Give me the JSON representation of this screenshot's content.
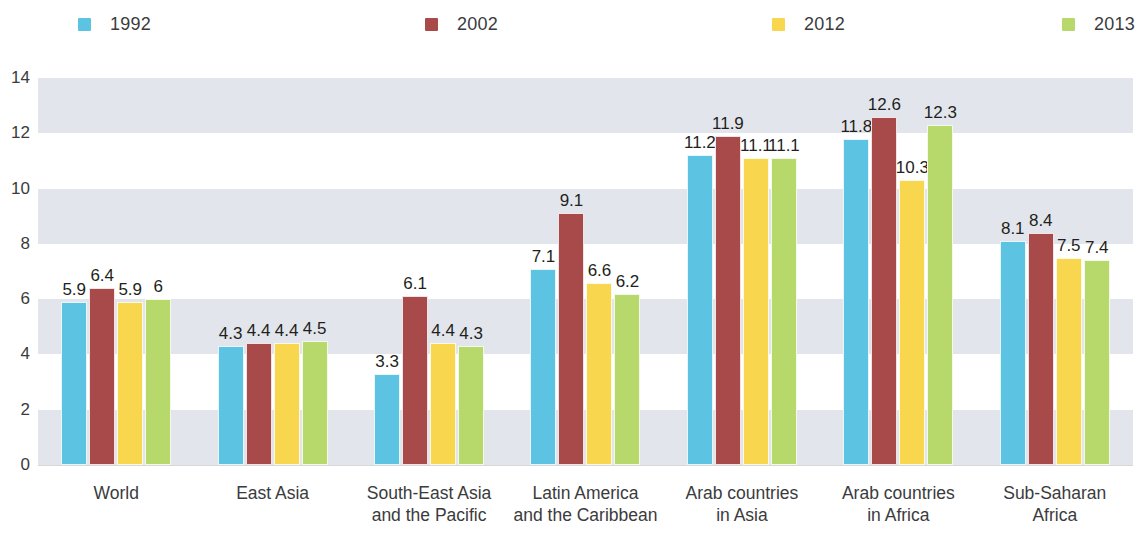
{
  "legend": {
    "items": [
      {
        "label": "1992",
        "color": "#5cc4e2",
        "x": 78
      },
      {
        "label": "2002",
        "color": "#a84a4a",
        "x": 425
      },
      {
        "label": "2012",
        "color": "#f8d64e",
        "x": 772
      },
      {
        "label": "2013",
        "color": "#b7d96b",
        "x": 1062
      }
    ]
  },
  "chart_data": {
    "type": "bar",
    "title": "",
    "subtitle": "",
    "xlabel": "",
    "ylabel": "",
    "ylim": [
      0,
      14
    ],
    "yticks": [
      0,
      2,
      4,
      6,
      8,
      10,
      12,
      14
    ],
    "grid": false,
    "banded_background": true,
    "legend_position": "top",
    "categories": [
      "World",
      "East Asia",
      "South-East Asia and the Pacific",
      "Latin America and the Caribbean",
      "Arab countries in Asia",
      "Arab countries in Africa",
      "Sub-Saharan Africa"
    ],
    "category_lines": [
      [
        "World",
        ""
      ],
      [
        "East Asia",
        ""
      ],
      [
        "South-East Asia",
        "and the Pacific"
      ],
      [
        "Latin America",
        "and the Caribbean"
      ],
      [
        "Arab countries",
        "in Asia"
      ],
      [
        "Arab countries",
        "in Africa"
      ],
      [
        "Sub-Saharan",
        "Africa"
      ]
    ],
    "series": [
      {
        "name": "1992",
        "color": "#5cc4e2",
        "values": [
          5.9,
          4.3,
          3.3,
          7.1,
          11.2,
          11.8,
          8.1
        ],
        "labels": [
          "5.9",
          "4.3",
          "3.3",
          "7.1",
          "11.2",
          "11.8",
          "8.1"
        ]
      },
      {
        "name": "2002",
        "color": "#a84a4a",
        "values": [
          6.4,
          4.4,
          6.1,
          9.1,
          11.9,
          12.6,
          8.4
        ],
        "labels": [
          "6.4",
          "4.4",
          "6.1",
          "9.1",
          "11.9",
          "12.6",
          "8.4"
        ]
      },
      {
        "name": "2012",
        "color": "#f8d64e",
        "values": [
          5.9,
          4.4,
          4.4,
          6.6,
          11.1,
          10.3,
          7.5
        ],
        "labels": [
          "5.9",
          "4.4",
          "4.4",
          "6.6",
          "11.1",
          "10.3",
          "7.5"
        ]
      },
      {
        "name": "2013",
        "color": "#b7d96b",
        "values": [
          6.0,
          4.5,
          4.3,
          6.2,
          11.1,
          12.3,
          7.4
        ],
        "labels": [
          "6",
          "4.5",
          "4.3",
          "6.2",
          "11.1",
          "7.4"
        ]
      }
    ],
    "series_2013_labels": [
      "6",
      "4.5",
      "4.3",
      "6.2",
      "11.1",
      "12.3",
      "7.4"
    ],
    "band_color": "#e2e6ec",
    "band_ranges": [
      [
        12,
        14
      ],
      [
        8,
        10
      ],
      [
        4,
        6
      ],
      [
        0,
        2
      ]
    ]
  }
}
